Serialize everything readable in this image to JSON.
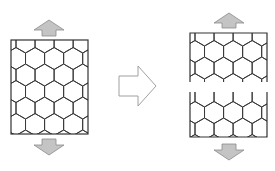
{
  "diagram": {
    "colors": {
      "background": "#ffffff",
      "lattice_stroke": "#3a3a3a",
      "force_arrow_fill": "#c4c4c4",
      "force_arrow_stroke": "#8a8a8a",
      "transition_arrow_stroke": "#a0a0a0"
    },
    "panels": [
      {
        "id": "intact",
        "label": "Intact lattice",
        "box": {
          "x": 11,
          "y": 40,
          "w": 77,
          "h": 94
        },
        "hex_radius": 11,
        "loads": [
          "up",
          "down"
        ]
      },
      {
        "id": "fractured-top",
        "label": "Upper fragment",
        "box": {
          "x": 190,
          "y": 33,
          "w": 77,
          "h": 49
        },
        "hex_radius": 11,
        "loads": [
          "up"
        ]
      },
      {
        "id": "fractured-bottom",
        "label": "Lower fragment",
        "box": {
          "x": 190,
          "y": 92,
          "w": 77,
          "h": 45
        },
        "hex_radius": 11,
        "loads": [
          "down"
        ]
      }
    ],
    "transition_arrow": {
      "icon": "right-arrow-outline",
      "x": 118,
      "y": 65,
      "w": 39,
      "h": 41
    }
  }
}
